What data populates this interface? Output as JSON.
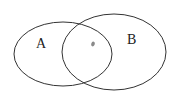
{
  "diagram": {
    "type": "venn",
    "sets": [
      {
        "label": "A",
        "cx": 63,
        "cy": 54,
        "rx": 49,
        "ry": 32
      },
      {
        "label": "B",
        "cx": 114,
        "cy": 52,
        "rx": 52,
        "ry": 38
      }
    ],
    "intersection_marker": {
      "x": 93,
      "y": 44,
      "color": "#8a8a8a"
    },
    "stroke_color": "#333333"
  }
}
